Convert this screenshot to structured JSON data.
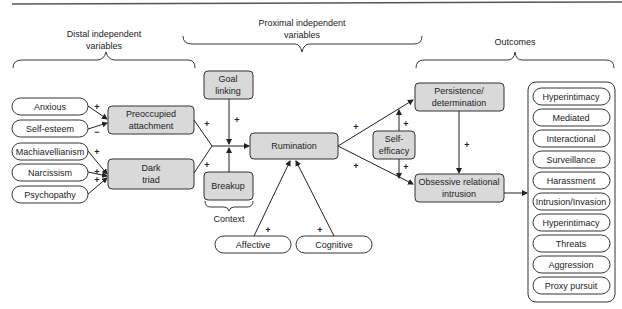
{
  "headers": {
    "distal": [
      "Distal independent",
      "variables"
    ],
    "proximal": [
      "Proximal independent",
      "variables"
    ],
    "outcomes": "Outcomes",
    "context": "Context"
  },
  "distal_inputs": [
    {
      "label": "Anxious",
      "sign": "+"
    },
    {
      "label": "Self-esteem",
      "sign": "−"
    },
    {
      "label": "Machiavellianism",
      "sign": "+"
    },
    {
      "label": "Narcissism",
      "sign": "+"
    },
    {
      "label": "Psychopathy",
      "sign": "+"
    }
  ],
  "nodes": {
    "preoccupied": [
      "Preoccupied",
      "attachment"
    ],
    "dark_triad": [
      "Dark",
      "triad"
    ],
    "goal_linking": [
      "Goal",
      "linking"
    ],
    "breakup": "Breakup",
    "rumination": "Rumination",
    "self_efficacy": [
      "Self-",
      "efficacy"
    ],
    "persistence": [
      "Persistence/",
      "determination"
    ],
    "ori": [
      "Obsessive relational",
      "intrusion"
    ],
    "affective": "Affective",
    "cognitive": "Cognitive"
  },
  "signs": {
    "preoccupied_to_rum": "+",
    "dark_to_rum": "+",
    "goal_to_rum": "+",
    "affective_to_rum": "+",
    "cognitive_to_rum": "+",
    "rum_to_persistence": "+",
    "rum_to_ori": "+",
    "self_eff_up": "+",
    "self_eff_down": "+",
    "persistence_to_ori": "+"
  },
  "outcomes": [
    "Hyperintimacy",
    "Mediated",
    "Interactional",
    "Surveillance",
    "Harassment",
    "Intrusion/Invasion",
    "Hyperintimacy",
    "Threats",
    "Aggression",
    "Proxy pursuit"
  ]
}
